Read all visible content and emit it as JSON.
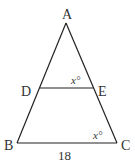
{
  "diagram": {
    "type": "triangle",
    "vertices": {
      "A": {
        "label": "A",
        "x": 66,
        "y": 23
      },
      "B": {
        "label": "B",
        "x": 17,
        "y": 143
      },
      "C": {
        "label": "C",
        "x": 117,
        "y": 143
      },
      "D": {
        "label": "D",
        "x": 40,
        "y": 88
      },
      "E": {
        "label": "E",
        "x": 93,
        "y": 88
      }
    },
    "segments": [
      "AB",
      "AC",
      "BC",
      "DE"
    ],
    "angle_labels": {
      "angle_E": "x°",
      "angle_C": "x°"
    },
    "side_labels": {
      "BC": "18"
    },
    "colors": {
      "stroke": "#222222",
      "text": "#333333"
    }
  }
}
